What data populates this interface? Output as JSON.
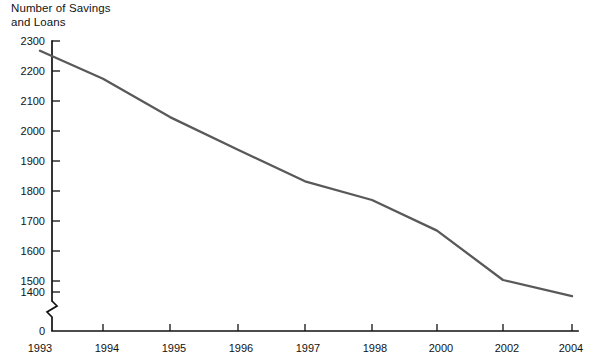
{
  "chart_data": {
    "type": "line",
    "title_line1": "Number of Savings",
    "title_line2": "and Loans",
    "xlabel": "",
    "ylabel": "Number of Savings and Loans",
    "categories": [
      "1993",
      "1994",
      "1995",
      "1996",
      "1997",
      "1998",
      "2000",
      "2002",
      "2004"
    ],
    "x": [
      1993,
      1994,
      1995,
      1996,
      1997,
      1998,
      2000,
      2002,
      2004
    ],
    "values": [
      2265,
      2165,
      2027,
      1910,
      1797,
      1730,
      1620,
      1443,
      1385
    ],
    "series": [
      {
        "name": "Number of Savings and Loans",
        "values": [
          2265,
          2165,
          2027,
          1910,
          1797,
          1730,
          1620,
          1443,
          1385
        ],
        "color": "#595959"
      }
    ],
    "ylim": [
      1400,
      2300
    ],
    "ytick_labels": [
      "2300",
      "2200",
      "2100",
      "2000",
      "1900",
      "1800",
      "1700",
      "1600",
      "1500",
      "1400",
      "0"
    ],
    "ytick_values": [
      2300,
      2200,
      2100,
      2000,
      1900,
      1800,
      1700,
      1600,
      1500,
      1400,
      0
    ],
    "xtick_labels": [
      "1993",
      "1994",
      "1995",
      "1996",
      "1997",
      "1998",
      "2000",
      "2002",
      "2004"
    ],
    "axis_break": true,
    "axis_break_note": "y-axis broken between 1400 and 0",
    "grid": false,
    "legend": "none",
    "line_color": "#595959",
    "axis_color": "#111111"
  }
}
